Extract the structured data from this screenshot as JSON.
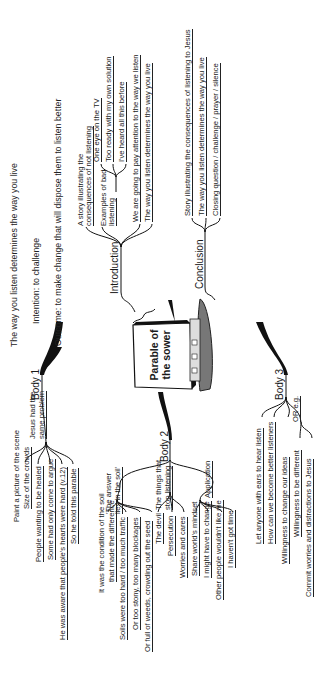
{
  "header": {
    "theme": "The way you listen determines the way you live",
    "intention": "Intention: to challenge",
    "outcome": "Outcome: to make change that will dispose them to listen better"
  },
  "center": {
    "title_line1": "Parable of",
    "title_line2": "the sower",
    "icon": "book-and-seed-tray-icon"
  },
  "introduction": {
    "label": "Introduction",
    "story": [
      "A story illustrating the",
      "consequences of not listening"
    ],
    "examples_label": [
      "Examples of bad",
      "listening"
    ],
    "examples": [
      "One eye on the TV",
      "Too ready with my own solution",
      "I've heard all this before"
    ],
    "points": [
      "We are going to pay attention to the way we listen",
      "The way you listen determines the way you live"
    ]
  },
  "conclusion": {
    "label": "Conclusion",
    "points": [
      "Story illustrating the consequences of listening to Jesus",
      "The way you listen determines the way you live",
      "Closing question / challenge / prayer / silence"
    ]
  },
  "body1": {
    "label": "Body 1",
    "sub_label": [
      "Jesus had the",
      "same problem"
    ],
    "intro": "Paint a picture of the scene",
    "points": [
      "Size of the crowds",
      "People wanting to be healed",
      "Some had only come to argue",
      "He was aware that people's hearts were hard (v.12)",
      "So he told this parable"
    ]
  },
  "body2": {
    "label": "Body 2",
    "answer": {
      "label": [
        "'The answer",
        "lies in the soil'"
      ],
      "intro": [
        "It was the condition of the soil",
        "that made the difference"
      ],
      "points": [
        "Soils were too hard / too much traffic",
        "Or too stony, too many blockages",
        "Or full of weeds, crowding out the seed"
      ]
    },
    "things": {
      "label": [
        "The things that",
        "stop listening"
      ],
      "points": [
        "The devil",
        "Persecution",
        "Worries and cares"
      ]
    },
    "application": {
      "label": "Application",
      "points": [
        "Share world's mindset",
        "I might have to change",
        "Other people wouldn't like me",
        "I haven't got time"
      ]
    }
  },
  "body3": {
    "label": "Body 3",
    "points": [
      "Let anyone with ears to hear listen",
      "How can we become better listeners",
      "Willingness to change our ideas"
    ],
    "or_label": "OR e.g.",
    "or_points": [
      "Willingness to be different",
      "Commit worries and distractions to Jesus"
    ]
  }
}
